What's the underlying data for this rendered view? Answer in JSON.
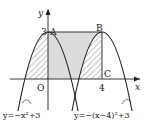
{
  "figure": {
    "axes": {
      "x_label": "x",
      "y_label": "y",
      "origin_label": "O"
    },
    "ticks": {
      "y_tick": "3",
      "x_tick": "4"
    },
    "points": [
      {
        "name": "A",
        "coords": [
          0,
          3
        ]
      },
      {
        "name": "B",
        "coords": [
          4,
          3
        ]
      },
      {
        "name": "C",
        "coords": [
          4,
          0
        ]
      }
    ],
    "curves": [
      {
        "name": "left-parabola",
        "equation": "y=−x²+3"
      },
      {
        "name": "right-parabola",
        "equation": "y=−(x−4)²+3"
      }
    ],
    "regions": [
      {
        "name": "hatched-left",
        "description": "area between left parabola and y-axis for x<0, above x-axis"
      },
      {
        "name": "shaded-rectangle",
        "description": "rectangle OABC minus right parabola part"
      },
      {
        "name": "hatched-right",
        "description": "area inside right parabola, 0≤x≤4 portion"
      }
    ],
    "colors": {
      "line": "#222222",
      "shade": "#d9d9d9",
      "hatch": "#555555"
    }
  }
}
